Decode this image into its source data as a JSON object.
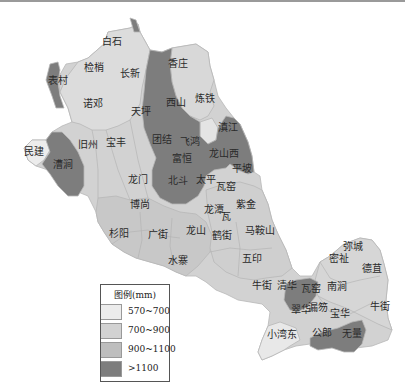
{
  "colors": {
    "c570_700": "#ececec",
    "c700_900": "#d2d2d2",
    "c900_1100": "#bebebe",
    "cgt1100": "#7d7d7d",
    "background": "#ffffff"
  },
  "legend": {
    "title": "图例(mm)",
    "items": [
      {
        "label": "570~700",
        "color": "#ececec"
      },
      {
        "label": "700~900",
        "color": "#d2d2d2"
      },
      {
        "label": "900~1100",
        "color": "#bebebe"
      },
      {
        "label": ">1100",
        "color": "#7d7d7d"
      }
    ]
  },
  "regions": [
    {
      "name": "白石",
      "x": 112,
      "y": 45
    },
    {
      "name": "检梢",
      "x": 94,
      "y": 71
    },
    {
      "name": "长新",
      "x": 130,
      "y": 77
    },
    {
      "name": "表村",
      "x": 58,
      "y": 84
    },
    {
      "name": "诺邓",
      "x": 93,
      "y": 107
    },
    {
      "name": "天坪",
      "x": 141,
      "y": 115
    },
    {
      "name": "香庄",
      "x": 178,
      "y": 67
    },
    {
      "name": "西山",
      "x": 176,
      "y": 106
    },
    {
      "name": "炼铁",
      "x": 205,
      "y": 102
    },
    {
      "name": "团结",
      "x": 162,
      "y": 143
    },
    {
      "name": "飞鸿",
      "x": 190,
      "y": 145
    },
    {
      "name": "滇江",
      "x": 228,
      "y": 131
    },
    {
      "name": "旧州",
      "x": 88,
      "y": 148
    },
    {
      "name": "宝丰",
      "x": 116,
      "y": 146
    },
    {
      "name": "民建",
      "x": 34,
      "y": 155
    },
    {
      "name": "漕涧",
      "x": 63,
      "y": 168
    },
    {
      "name": "富恒",
      "x": 182,
      "y": 162
    },
    {
      "name": "龙山西",
      "x": 224,
      "y": 157
    },
    {
      "name": "平坡",
      "x": 242,
      "y": 172
    },
    {
      "name": "龙门",
      "x": 138,
      "y": 183
    },
    {
      "name": "北斗",
      "x": 178,
      "y": 184
    },
    {
      "name": "太平",
      "x": 206,
      "y": 183
    },
    {
      "name": "瓦窑",
      "x": 226,
      "y": 190
    },
    {
      "name": "博尚",
      "x": 140,
      "y": 208
    },
    {
      "name": "紫金",
      "x": 246,
      "y": 208
    },
    {
      "name": "龙潭",
      "x": 214,
      "y": 213
    },
    {
      "name": "瓦",
      "x": 226,
      "y": 220
    },
    {
      "name": "杉阳",
      "x": 119,
      "y": 237
    },
    {
      "name": "广街",
      "x": 158,
      "y": 238
    },
    {
      "name": "龙山",
      "x": 196,
      "y": 234
    },
    {
      "name": "鹤街",
      "x": 222,
      "y": 239
    },
    {
      "name": "马鞍山",
      "x": 260,
      "y": 234
    },
    {
      "name": "水寨",
      "x": 178,
      "y": 264
    },
    {
      "name": "五印",
      "x": 252,
      "y": 262
    },
    {
      "name": "牛街",
      "x": 262,
      "y": 289
    },
    {
      "name": "清华",
      "x": 287,
      "y": 289
    },
    {
      "name": "瓦窑",
      "x": 311,
      "y": 292
    },
    {
      "name": "密祉",
      "x": 339,
      "y": 262
    },
    {
      "name": "弥城",
      "x": 353,
      "y": 250
    },
    {
      "name": "德苴",
      "x": 372,
      "y": 272
    },
    {
      "name": "南涧",
      "x": 337,
      "y": 290
    },
    {
      "name": "翠华",
      "x": 301,
      "y": 313
    },
    {
      "name": "漏笏",
      "x": 318,
      "y": 311
    },
    {
      "name": "宝华",
      "x": 340,
      "y": 317
    },
    {
      "name": "牛街",
      "x": 380,
      "y": 310
    },
    {
      "name": "小湾东",
      "x": 282,
      "y": 338
    },
    {
      "name": "公郎",
      "x": 322,
      "y": 336
    },
    {
      "name": "无量",
      "x": 352,
      "y": 337
    }
  ]
}
